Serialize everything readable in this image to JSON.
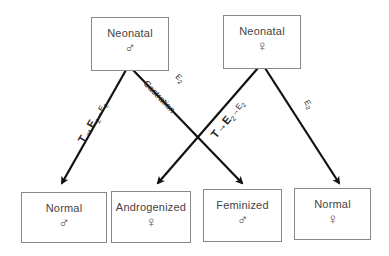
{
  "top_boxes": [
    {
      "label": "Neonatal",
      "symbol": "♂",
      "symbol_name": "male"
    },
    {
      "label": "Neonatal",
      "symbol": "♀",
      "symbol_name": "female"
    }
  ],
  "bottom_boxes": [
    {
      "label": "Normal",
      "symbol": "♂",
      "symbol_name": "male"
    },
    {
      "label": "Androgenized",
      "symbol": "♀",
      "symbol_name": "female"
    },
    {
      "label": "Feminized",
      "symbol": "♂",
      "symbol_name": "male"
    },
    {
      "label": "Normal",
      "symbol": "♀",
      "symbol_name": "female"
    }
  ],
  "arrows": [
    {
      "from": "Neonatal ♂",
      "to": "Normal ♂",
      "label_main": "T→E",
      "label_sub": "2",
      "label_rest": "→E",
      "label_sub2": "2"
    },
    {
      "from": "Neonatal ♂",
      "to": "Feminized ♂",
      "label_top": "E",
      "label_top_sub": "2",
      "label_bottom": "Castration"
    },
    {
      "from": "Neonatal ♀",
      "to": "Androgenized ♀",
      "label_main": "T→E",
      "label_sub": "2",
      "label_rest": "→E",
      "label_sub2": "2"
    },
    {
      "from": "Neonatal ♀",
      "to": "Normal ♀",
      "label_top": "E",
      "label_top_sub": "2"
    }
  ]
}
